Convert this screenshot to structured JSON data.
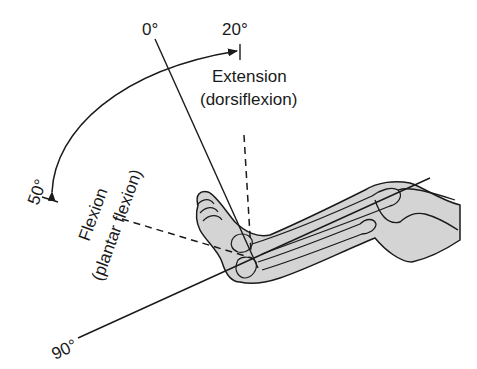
{
  "diagram": {
    "angles": {
      "zero": "0°",
      "extension_limit": "20°",
      "flexion_limit": "50°",
      "ninety": "90°"
    },
    "labels": {
      "extension_line1": "Extension",
      "extension_line2": "(dorsiflexion)",
      "flexion_line1": "Flexion",
      "flexion_line2": "(plantar flexion)"
    },
    "colors": {
      "line": "#1a1a1a",
      "leg_fill": "#d4d4d4",
      "background": "#ffffff"
    }
  }
}
